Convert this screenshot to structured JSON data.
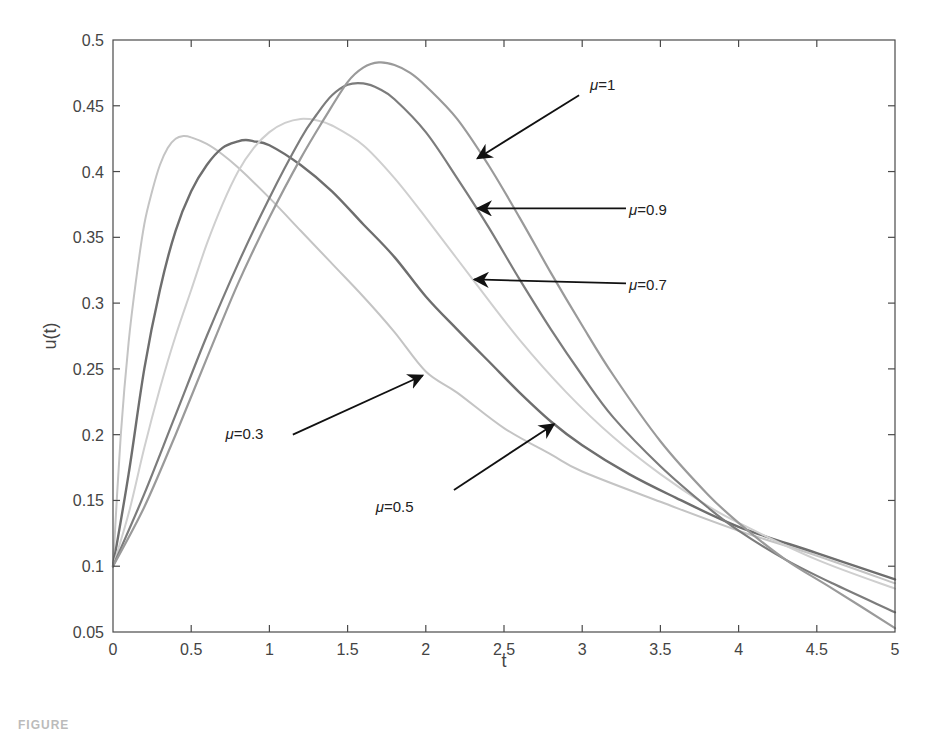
{
  "chart_data": {
    "type": "line",
    "title": "",
    "xlabel": "t",
    "ylabel": "u(t)",
    "xlim": [
      0,
      5
    ],
    "ylim": [
      0.05,
      0.5
    ],
    "grid": false,
    "legend": "none (inline arrow annotations)",
    "xticks": [
      "0",
      "0.5",
      "1",
      "1.5",
      "2",
      "2.5",
      "3",
      "3.5",
      "4",
      "4.5",
      "5"
    ],
    "yticks": [
      "0.05",
      "0.1",
      "0.15",
      "0.2",
      "0.25",
      "0.3",
      "0.35",
      "0.4",
      "0.45",
      "0.5"
    ],
    "series": [
      {
        "name": "μ=0.3",
        "color": "#c4c4c4",
        "width": 2,
        "points": [
          [
            0,
            0.1
          ],
          [
            0.05,
            0.2
          ],
          [
            0.1,
            0.27
          ],
          [
            0.15,
            0.32
          ],
          [
            0.2,
            0.36
          ],
          [
            0.25,
            0.385
          ],
          [
            0.3,
            0.405
          ],
          [
            0.35,
            0.418
          ],
          [
            0.4,
            0.425
          ],
          [
            0.45,
            0.427
          ],
          [
            0.5,
            0.426
          ],
          [
            0.6,
            0.421
          ],
          [
            0.7,
            0.413
          ],
          [
            0.8,
            0.403
          ],
          [
            1.0,
            0.38
          ],
          [
            1.2,
            0.355
          ],
          [
            1.4,
            0.33
          ],
          [
            1.6,
            0.305
          ],
          [
            1.8,
            0.278
          ],
          [
            2.0,
            0.248
          ],
          [
            2.2,
            0.232
          ],
          [
            2.5,
            0.205
          ],
          [
            2.8,
            0.185
          ],
          [
            3.0,
            0.172
          ],
          [
            3.5,
            0.149
          ],
          [
            4.0,
            0.127
          ],
          [
            4.5,
            0.108
          ],
          [
            5.0,
            0.087
          ]
        ]
      },
      {
        "name": "μ=0.5",
        "color": "#6e6e6e",
        "width": 2.4,
        "points": [
          [
            0,
            0.1
          ],
          [
            0.1,
            0.17
          ],
          [
            0.2,
            0.25
          ],
          [
            0.3,
            0.31
          ],
          [
            0.4,
            0.355
          ],
          [
            0.5,
            0.385
          ],
          [
            0.6,
            0.405
          ],
          [
            0.7,
            0.418
          ],
          [
            0.8,
            0.423
          ],
          [
            0.85,
            0.424
          ],
          [
            0.9,
            0.423
          ],
          [
            1.0,
            0.42
          ],
          [
            1.2,
            0.405
          ],
          [
            1.4,
            0.385
          ],
          [
            1.6,
            0.36
          ],
          [
            1.8,
            0.335
          ],
          [
            2.0,
            0.305
          ],
          [
            2.2,
            0.28
          ],
          [
            2.4,
            0.256
          ],
          [
            2.6,
            0.232
          ],
          [
            2.8,
            0.21
          ],
          [
            3.0,
            0.192
          ],
          [
            3.3,
            0.17
          ],
          [
            3.6,
            0.152
          ],
          [
            4.0,
            0.13
          ],
          [
            4.5,
            0.11
          ],
          [
            5.0,
            0.09
          ]
        ]
      },
      {
        "name": "μ=0.7",
        "color": "#cfcfcf",
        "width": 2,
        "points": [
          [
            0,
            0.1
          ],
          [
            0.1,
            0.14
          ],
          [
            0.2,
            0.19
          ],
          [
            0.3,
            0.235
          ],
          [
            0.4,
            0.275
          ],
          [
            0.5,
            0.31
          ],
          [
            0.6,
            0.345
          ],
          [
            0.7,
            0.375
          ],
          [
            0.8,
            0.4
          ],
          [
            0.9,
            0.418
          ],
          [
            1.0,
            0.43
          ],
          [
            1.1,
            0.437
          ],
          [
            1.2,
            0.44
          ],
          [
            1.3,
            0.439
          ],
          [
            1.4,
            0.435
          ],
          [
            1.6,
            0.42
          ],
          [
            1.8,
            0.395
          ],
          [
            2.0,
            0.365
          ],
          [
            2.3,
            0.318
          ],
          [
            2.6,
            0.272
          ],
          [
            2.9,
            0.232
          ],
          [
            3.2,
            0.198
          ],
          [
            3.5,
            0.17
          ],
          [
            3.8,
            0.146
          ],
          [
            4.0,
            0.133
          ],
          [
            4.5,
            0.105
          ],
          [
            5.0,
            0.083
          ]
        ]
      },
      {
        "name": "μ=0.9",
        "color": "#7c7c7c",
        "width": 2.2,
        "points": [
          [
            0,
            0.1
          ],
          [
            0.2,
            0.155
          ],
          [
            0.4,
            0.215
          ],
          [
            0.6,
            0.275
          ],
          [
            0.8,
            0.33
          ],
          [
            1.0,
            0.38
          ],
          [
            1.2,
            0.425
          ],
          [
            1.3,
            0.443
          ],
          [
            1.4,
            0.458
          ],
          [
            1.5,
            0.466
          ],
          [
            1.6,
            0.467
          ],
          [
            1.7,
            0.463
          ],
          [
            1.8,
            0.455
          ],
          [
            2.0,
            0.43
          ],
          [
            2.2,
            0.395
          ],
          [
            2.4,
            0.358
          ],
          [
            2.6,
            0.318
          ],
          [
            2.8,
            0.28
          ],
          [
            3.0,
            0.245
          ],
          [
            3.2,
            0.213
          ],
          [
            3.5,
            0.176
          ],
          [
            3.8,
            0.145
          ],
          [
            4.0,
            0.127
          ],
          [
            4.3,
            0.105
          ],
          [
            4.6,
            0.087
          ],
          [
            5.0,
            0.065
          ]
        ]
      },
      {
        "name": "μ=1",
        "color": "#9a9a9a",
        "width": 2.2,
        "points": [
          [
            0,
            0.1
          ],
          [
            0.2,
            0.145
          ],
          [
            0.4,
            0.2
          ],
          [
            0.6,
            0.258
          ],
          [
            0.8,
            0.315
          ],
          [
            1.0,
            0.365
          ],
          [
            1.2,
            0.41
          ],
          [
            1.35,
            0.44
          ],
          [
            1.5,
            0.468
          ],
          [
            1.6,
            0.479
          ],
          [
            1.7,
            0.483
          ],
          [
            1.8,
            0.481
          ],
          [
            1.9,
            0.475
          ],
          [
            2.0,
            0.465
          ],
          [
            2.2,
            0.44
          ],
          [
            2.4,
            0.405
          ],
          [
            2.6,
            0.365
          ],
          [
            2.8,
            0.323
          ],
          [
            3.0,
            0.283
          ],
          [
            3.2,
            0.245
          ],
          [
            3.5,
            0.195
          ],
          [
            3.8,
            0.155
          ],
          [
            4.0,
            0.133
          ],
          [
            4.3,
            0.105
          ],
          [
            4.6,
            0.083
          ],
          [
            5.0,
            0.053
          ]
        ]
      }
    ],
    "annotations": [
      {
        "series": "μ=1",
        "label_mu": "μ",
        "label_value": "=1",
        "text_xy": [
          3.05,
          0.462
        ],
        "arrow_from": [
          2.98,
          0.458
        ],
        "arrow_to": [
          2.33,
          0.41
        ]
      },
      {
        "series": "μ=0.9",
        "label_mu": "μ",
        "label_value": "=0.9",
        "text_xy": [
          3.3,
          0.367
        ],
        "arrow_from": [
          3.28,
          0.372
        ],
        "arrow_to": [
          2.33,
          0.372
        ]
      },
      {
        "series": "μ=0.7",
        "label_mu": "μ",
        "label_value": "=0.7",
        "text_xy": [
          3.3,
          0.31
        ],
        "arrow_from": [
          3.28,
          0.315
        ],
        "arrow_to": [
          2.31,
          0.318
        ]
      },
      {
        "series": "μ=0.3",
        "label_mu": "μ",
        "label_value": "=0.3",
        "text_xy": [
          0.72,
          0.197
        ],
        "arrow_from": [
          1.15,
          0.2
        ],
        "arrow_to": [
          1.98,
          0.245
        ]
      },
      {
        "series": "μ=0.5",
        "label_mu": "μ",
        "label_value": "=0.5",
        "text_xy": [
          1.68,
          0.141
        ],
        "arrow_from": [
          2.18,
          0.158
        ],
        "arrow_to": [
          2.82,
          0.208
        ]
      }
    ]
  },
  "caption": "FIGURE"
}
